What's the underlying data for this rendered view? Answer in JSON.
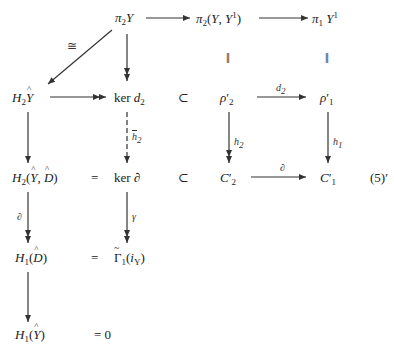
{
  "diagram": {
    "equation_tag": "(5)′",
    "nodes": {
      "pi2Y": "π₂Y",
      "pi2YY1": "π₂(Y, Y¹)",
      "pi1Y1": "π₁Y¹",
      "H2Yhat": "H₂Ŷ",
      "kerd2": "ker d₂",
      "rho2": "ρ′₂",
      "rho1": "ρ′₁",
      "H2YD": "H₂(Ŷ, D̂)",
      "kerdel": "ker ∂",
      "C2": "C′₂",
      "C1": "C′₁",
      "H1D": "H₁(D̂)",
      "Gamma1": "Γ̃₁(i_Y)",
      "H1Y": "H₁(Ŷ)"
    },
    "relations": {
      "subset1": "⊂",
      "subset2": "⊂",
      "subset3": "⊂",
      "subset4": "⊂",
      "eq1": "=",
      "eq2": "=",
      "eq_zero": "= 0",
      "parallel1": "‖",
      "parallel2": "‖"
    },
    "arrow_labels": {
      "iso": "≅",
      "d2": "d₂",
      "h2bar": "h̄₂",
      "h2": "h₂",
      "h1": "h₁",
      "del_horizontal": "∂",
      "del_vertical": "∂",
      "gamma": "γ"
    },
    "arrows": [
      {
        "from": "pi2Y",
        "to": "pi2YY1",
        "type": "mono"
      },
      {
        "from": "pi2YY1",
        "to": "pi1Y1",
        "type": "mono"
      },
      {
        "from": "pi2Y",
        "to": "H2Yhat",
        "type": "iso",
        "label": "≅"
      },
      {
        "from": "pi2Y",
        "to": "kerd2",
        "type": "epi"
      },
      {
        "from": "H2Yhat",
        "to": "kerd2",
        "type": "epi"
      },
      {
        "from": "rho2",
        "to": "rho1",
        "type": "mono",
        "label": "d₂"
      },
      {
        "from": "H2Yhat",
        "to": "H2YD",
        "type": "mono"
      },
      {
        "from": "kerd2",
        "to": "kerdel",
        "type": "dashed",
        "label": "h̄₂"
      },
      {
        "from": "rho2",
        "to": "C2",
        "type": "epi",
        "label": "h₂"
      },
      {
        "from": "rho1",
        "to": "C1",
        "type": "mono",
        "label": "h₁"
      },
      {
        "from": "C2",
        "to": "C1",
        "type": "mono",
        "label": "∂"
      },
      {
        "from": "H2YD",
        "to": "H1D",
        "type": "epi",
        "label": "∂"
      },
      {
        "from": "kerdel",
        "to": "Gamma1",
        "type": "epi",
        "label": "γ"
      },
      {
        "from": "H1D",
        "to": "H1Y",
        "type": "mono"
      }
    ]
  }
}
